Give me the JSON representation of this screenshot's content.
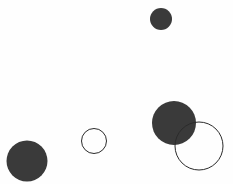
{
  "canvas": {
    "width": 233,
    "height": 184,
    "background_color": "#fefefe",
    "title": "Circles"
  },
  "palette": {
    "fill_dark": "#3a3a3a",
    "stroke_dark": "#2b2b2b",
    "background": "#fefefe"
  },
  "chart_data": {
    "type": "scatter",
    "title": "",
    "subtitle": "",
    "xlabel": "",
    "ylabel": "",
    "xlim": [
      0,
      233
    ],
    "ylim": [
      0,
      184
    ],
    "grid": false,
    "legend": null,
    "axes_visible": false,
    "tick_labels": {
      "x": [],
      "y": []
    },
    "annotations": [],
    "marker_units": "pixels",
    "series": [
      {
        "name": "filled-circles",
        "marker_style": "filled",
        "fill_color": "#3a3a3a",
        "stroke_color": "none",
        "stroke_width": 0,
        "points": [
          {
            "id": "filled-small-top",
            "x": 161,
            "y": 19,
            "diameter": 22,
            "radius": 11
          },
          {
            "id": "filled-large-bottom-right",
            "x": 174,
            "y": 123,
            "diameter": 44,
            "radius": 22
          },
          {
            "id": "filled-medium-bottom-left",
            "x": 27,
            "y": 161,
            "diameter": 41,
            "radius": 20.5
          }
        ]
      },
      {
        "name": "outline-circles",
        "marker_style": "outline",
        "fill_color": "none",
        "stroke_color": "#2b2b2b",
        "stroke_width": 1,
        "points": [
          {
            "id": "outline-small-center",
            "x": 94,
            "y": 141,
            "diameter": 25,
            "radius": 12.5
          },
          {
            "id": "outline-large-bottom-right",
            "x": 199,
            "y": 146,
            "diameter": 48,
            "radius": 24
          }
        ]
      }
    ],
    "counts": {
      "filled": 3,
      "outline": 2,
      "total": 5
    }
  }
}
